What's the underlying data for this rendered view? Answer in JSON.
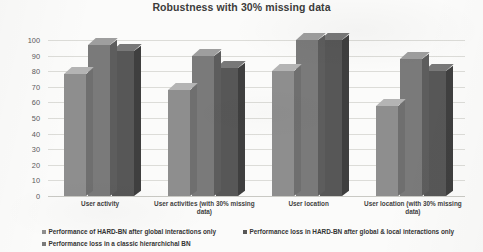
{
  "chart_data": {
    "type": "bar",
    "title": "Robustness with 30% missing data",
    "xlabel": "",
    "ylabel": "",
    "ylim": [
      0,
      100
    ],
    "yticks": [
      0,
      10,
      20,
      30,
      40,
      50,
      60,
      70,
      80,
      90,
      100
    ],
    "grid": true,
    "legend_position": "bottom",
    "style": "3d-grouped-bar",
    "categories": [
      "User activity",
      "User activities (with 30% missing data)",
      "User location",
      "User location (with 30% missing data)"
    ],
    "series": [
      {
        "name": "Performance of HARD-BN after global interactions only",
        "color": "#8e8e8e",
        "values": [
          78,
          68,
          80,
          58
        ]
      },
      {
        "name": "Performance loss in a classic hierarchichal BN",
        "color": "#7a7a7a",
        "values": [
          97,
          90,
          100,
          88
        ]
      },
      {
        "name": "Performance loss in HARD-BN after global & local interactions only",
        "color": "#575757",
        "values": [
          93,
          82,
          100,
          80
        ]
      }
    ]
  },
  "legend": {
    "items": [
      {
        "label": "Performance of HARD-BN after global interactions only"
      },
      {
        "label": "Performance loss in HARD-BN after global & local interactions only"
      },
      {
        "label": "Performance loss in a classic hierarchichal BN"
      }
    ]
  },
  "axis": {
    "y_tick_labels": [
      "100",
      "90",
      "80",
      "70",
      "60",
      "50",
      "40",
      "30",
      "20",
      "10",
      "0"
    ]
  }
}
